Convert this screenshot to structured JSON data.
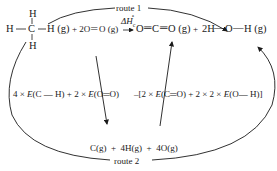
{
  "diagram": {
    "type": "hess-cycle",
    "routes": {
      "route1_label": "route 1",
      "route2_label": "route 2"
    },
    "methane": {
      "h_top": "H",
      "h_left": "H",
      "c": "C",
      "h_bottom": "H",
      "h_right_state": "H (g)"
    },
    "reactants_rest": "+ 2O",
    "o2_state": "O (g)",
    "enthalpy_label": "ΔH",
    "enthalpy_sub": "c",
    "enthalpy_sup": "∘",
    "products": {
      "co2": "O",
      "co2_c": "C",
      "co2_state": "O (g)",
      "plus": "+",
      "water_coef": "2H",
      "water_o": "O",
      "water_h": "H (g)"
    },
    "atoms_line": "C(g)  +  4H(g)  +  4O(g)",
    "bond_break": {
      "part1_coef": "4 × ",
      "part1_E": "E",
      "part1_bond": "(C — H)",
      "plus": " + ",
      "part2_coef": "2 × ",
      "part2_E": "E",
      "part2_bond": "(O═O)"
    },
    "bond_make": {
      "lead": "–[2 × ",
      "E1": "E",
      "bond1": "(C═O)",
      "plus": "  +  2 × 2 × ",
      "E2": "E",
      "bond2": "(O— H)]"
    },
    "colors": {
      "ink": "#1a1a1a",
      "background": "#ffffff"
    }
  }
}
